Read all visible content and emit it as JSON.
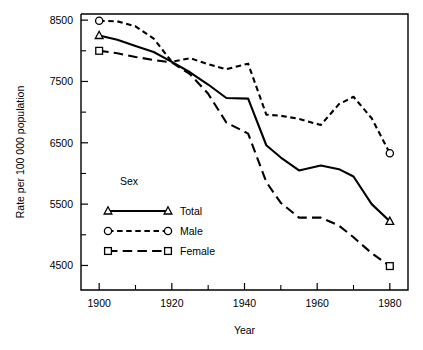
{
  "chart_data": {
    "type": "line",
    "title": "",
    "xlabel": "Year",
    "ylabel": "Rate per 100 000 population",
    "xlim": [
      1895,
      1985
    ],
    "ylim": [
      4100,
      8600
    ],
    "grid": false,
    "legend_position": "inner-left",
    "legend_title": "Sex",
    "x_ticks_major": [
      1900,
      1920,
      1940,
      1960,
      1980
    ],
    "x_ticks_minor": [
      1910,
      1930,
      1950,
      1970
    ],
    "x_tick_labels": [
      "1900",
      "1920",
      "1940",
      "1960",
      "1980"
    ],
    "y_ticks_major": [
      4500,
      5500,
      6500,
      7500,
      8500
    ],
    "y_ticks_minor": [
      5000,
      6000,
      7000,
      8000
    ],
    "y_tick_labels": [
      "4500",
      "5500",
      "6500",
      "7500",
      "8500"
    ],
    "series": [
      {
        "name": "Total",
        "line_style": "solid",
        "marker": "triangle",
        "x": [
          1900,
          1905,
          1910,
          1915,
          1920,
          1925,
          1930,
          1935,
          1941,
          1946,
          1950,
          1955,
          1961,
          1966,
          1970,
          1975,
          1980
        ],
        "values": [
          8250,
          8180,
          8080,
          7980,
          7820,
          7650,
          7450,
          7230,
          7220,
          6460,
          6260,
          6050,
          6130,
          6070,
          5950,
          5500,
          5220
        ]
      },
      {
        "name": "Male",
        "line_style": "short-dash",
        "marker": "circle",
        "x": [
          1900,
          1905,
          1910,
          1915,
          1920,
          1925,
          1930,
          1935,
          1941,
          1946,
          1950,
          1955,
          1961,
          1966,
          1970,
          1975,
          1980
        ],
        "values": [
          8490,
          8480,
          8400,
          8200,
          7820,
          7880,
          7780,
          7700,
          7790,
          6960,
          6940,
          6890,
          6790,
          7130,
          7250,
          6900,
          6330
        ]
      },
      {
        "name": "Female",
        "line_style": "long-dash",
        "marker": "square",
        "x": [
          1900,
          1905,
          1910,
          1915,
          1920,
          1925,
          1930,
          1935,
          1941,
          1946,
          1950,
          1955,
          1961,
          1966,
          1970,
          1975,
          1980
        ],
        "values": [
          8000,
          7960,
          7900,
          7850,
          7810,
          7620,
          7300,
          6830,
          6650,
          5860,
          5520,
          5280,
          5280,
          5150,
          4960,
          4700,
          4490
        ]
      }
    ]
  },
  "legend": {
    "title": "Sex",
    "entries": [
      {
        "label": "Total",
        "marker": "triangle-icon",
        "style": "solid"
      },
      {
        "label": "Male",
        "marker": "circle-icon",
        "style": "short-dash"
      },
      {
        "label": "Female",
        "marker": "square-icon",
        "style": "long-dash"
      }
    ]
  },
  "axes": {
    "x_title": "Year",
    "y_title": "Rate per 100 000 population"
  }
}
